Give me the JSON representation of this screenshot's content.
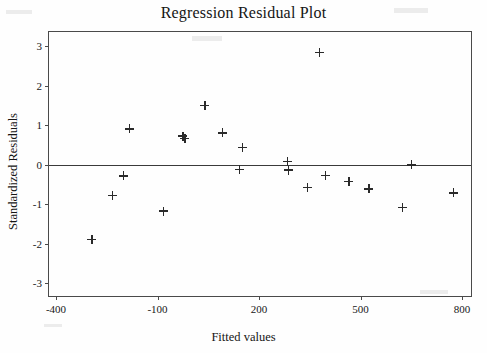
{
  "chart_data": {
    "type": "scatter",
    "title": "Regression Residual Plot",
    "xlabel": "Fitted values",
    "ylabel": "Standardized Residuals",
    "xlim": [
      -400,
      800
    ],
    "ylim": [
      -3,
      3
    ],
    "xticks": [
      -400,
      -100,
      200,
      500,
      800
    ],
    "xtick_labels": [
      "-400",
      "-100",
      "200",
      "500",
      "800"
    ],
    "yticks": [
      3,
      2,
      1,
      0,
      -1,
      -2,
      -3
    ],
    "ytick_labels": [
      "3",
      "2",
      "1",
      "0",
      "-1",
      "-2",
      "-3"
    ],
    "grid": false,
    "legend": null,
    "marker": "plus",
    "marker_color": "#2a2a2a",
    "reference_line": {
      "y": 0,
      "color": "#3a3a3a",
      "style": "solid"
    },
    "points": [
      {
        "x": -294,
        "y": -1.9
      },
      {
        "x": -234,
        "y": -0.79
      },
      {
        "x": -200,
        "y": -0.29
      },
      {
        "x": -182,
        "y": 0.9
      },
      {
        "x": -82,
        "y": -1.18
      },
      {
        "x": -25,
        "y": 0.72
      },
      {
        "x": -19,
        "y": 0.66
      },
      {
        "x": 40,
        "y": 1.49
      },
      {
        "x": 92,
        "y": 0.8
      },
      {
        "x": 151,
        "y": 0.43
      },
      {
        "x": 142,
        "y": -0.13
      },
      {
        "x": 285,
        "y": 0.08
      },
      {
        "x": 288,
        "y": -0.14
      },
      {
        "x": 343,
        "y": -0.59
      },
      {
        "x": 378,
        "y": 2.84
      },
      {
        "x": 396,
        "y": -0.27
      },
      {
        "x": 466,
        "y": -0.43
      },
      {
        "x": 525,
        "y": -0.62
      },
      {
        "x": 625,
        "y": -1.09
      },
      {
        "x": 650,
        "y": -0.01
      },
      {
        "x": 775,
        "y": -0.72
      }
    ]
  }
}
